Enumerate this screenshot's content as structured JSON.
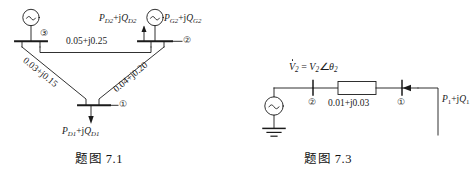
{
  "page": {
    "background": "#ffffff",
    "ink": "#1a1a1a",
    "width": 465,
    "height": 171
  },
  "figure_left": {
    "caption_cn": "题图",
    "caption_num": "7.1",
    "caption_full": "题图 7.1",
    "nodes": [
      {
        "id": "node-1",
        "label": "①"
      },
      {
        "id": "node-2",
        "label": "②"
      },
      {
        "id": "node-3",
        "label": "③"
      }
    ],
    "branches": [
      {
        "id": "branch-3-2",
        "impedance": "0.05+j0.25",
        "from": "③",
        "to": "②"
      },
      {
        "id": "branch-3-1",
        "impedance": "0.03+j0.15",
        "from": "③",
        "to": "①"
      },
      {
        "id": "branch-2-1",
        "impedance": "0.04+j0.20",
        "from": "②",
        "to": "①"
      }
    ],
    "injections": [
      {
        "id": "load-2",
        "P": "P",
        "Psub": "D2",
        "Q": "Q",
        "Qsub": "D2",
        "text": "P_D2+jQ_D2",
        "direction": "up"
      },
      {
        "id": "gen-2",
        "P": "P",
        "Psub": "G2",
        "Q": "Q",
        "Qsub": "G2",
        "text": "P_G2+jQ_G2",
        "direction": "in"
      },
      {
        "id": "load-1",
        "P": "P",
        "Psub": "D1",
        "Q": "Q",
        "Qsub": "D1",
        "text": "P_D1+jQ_D1",
        "direction": "down"
      }
    ],
    "generators": [
      {
        "id": "generator-3",
        "symbol": "∼"
      },
      {
        "id": "generator-2",
        "symbol": "∼"
      }
    ]
  },
  "figure_right": {
    "caption_cn": "题图",
    "caption_num": "7.3",
    "caption_full": "题图 7.3",
    "voltage_label": {
      "text": "V̇₂ = V₂∠θ₂",
      "v_dot": "V",
      "sub2": "2",
      "eq": "=",
      "mag": "V",
      "angle_symbol": "∠",
      "theta": "θ"
    },
    "nodes": [
      {
        "id": "node-2",
        "label": "②"
      },
      {
        "id": "node-1",
        "label": "①"
      }
    ],
    "branches": [
      {
        "id": "branch-2-1",
        "impedance": "0.01+j0.03",
        "from": "②",
        "to": "①"
      }
    ],
    "injections": [
      {
        "id": "power-1",
        "text": "P₁+jQ₁",
        "P": "P",
        "Psub": "1",
        "Q": "Q",
        "Qsub": "1"
      }
    ],
    "generators": [
      {
        "id": "source-generator",
        "symbol": "∼"
      }
    ],
    "ground": {
      "id": "ground-symbol",
      "label": "ground"
    }
  }
}
